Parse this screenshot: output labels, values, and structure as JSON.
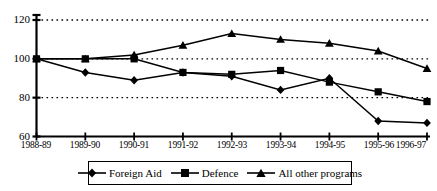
{
  "chart_data": {
    "type": "line",
    "title": "",
    "xlabel": "",
    "ylabel": "",
    "categories": [
      "1988-89",
      "1989-90",
      "1990-91",
      "1991-92",
      "1992-93",
      "1993-94",
      "1994-95",
      "1995-96",
      "1996-97"
    ],
    "series": [
      {
        "name": "Foreign Aid",
        "marker": "diamond",
        "values": [
          100,
          93,
          89,
          93,
          91,
          84,
          90,
          68,
          67
        ]
      },
      {
        "name": "Defence",
        "marker": "square",
        "values": [
          100,
          100,
          100,
          93,
          92,
          94,
          88,
          83,
          78
        ]
      },
      {
        "name": "All other programs",
        "marker": "triangle",
        "values": [
          100,
          100,
          102,
          107,
          113,
          110,
          108,
          104,
          95
        ]
      }
    ],
    "ylim": [
      60,
      120
    ],
    "yticks": [
      60,
      80,
      100,
      120
    ],
    "ytick_labels": [
      "60",
      "80",
      "100",
      "120"
    ],
    "grid": "horizontal-dotted",
    "legend_position": "bottom",
    "line_color": "#000000",
    "grid_color": "#000000",
    "axis_color": "#000000"
  },
  "legend": {
    "items": [
      {
        "label": "Foreign Aid",
        "marker": "diamond-marker-icon"
      },
      {
        "label": "Defence",
        "marker": "square-marker-icon"
      },
      {
        "label": "All other programs",
        "marker": "triangle-marker-icon"
      }
    ]
  }
}
